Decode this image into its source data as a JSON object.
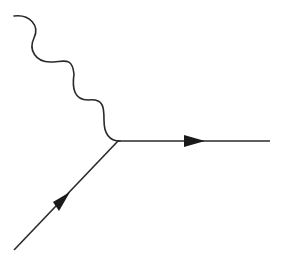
{
  "diagram": {
    "type": "feynman-diagram",
    "colors": {
      "line": "#2a2a2a",
      "background": "#ffffff"
    },
    "vertex": {
      "x": 117,
      "y": 141
    },
    "edges": [
      {
        "name": "photon",
        "kind": "wavy",
        "from": [
          14,
          16
        ],
        "to": [
          117,
          141
        ]
      },
      {
        "name": "outgoing-fermion",
        "kind": "straight-arrow",
        "from": [
          117,
          141
        ],
        "to": [
          270,
          141
        ],
        "arrow_direction": "right"
      },
      {
        "name": "incoming-fermion",
        "kind": "straight-arrow",
        "from": [
          14,
          250
        ],
        "to": [
          117,
          141
        ],
        "arrow_direction": "up-right"
      }
    ]
  }
}
